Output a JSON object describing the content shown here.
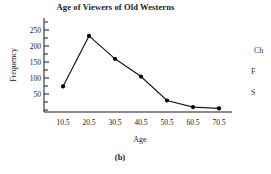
{
  "figure": {
    "caption": "(b)"
  },
  "chart_data": {
    "type": "line",
    "title": "Age of Viewers of Old Westerns",
    "xlabel": "Age",
    "ylabel": "Frequency",
    "categories": [
      "10.5",
      "20.5",
      "30.5",
      "40.5",
      "50.5",
      "60.5",
      "70.5"
    ],
    "x": [
      10.5,
      20.5,
      30.5,
      40.5,
      50.5,
      60.5,
      70.5
    ],
    "values": [
      78,
      232,
      162,
      108,
      35,
      15,
      11
    ],
    "series": [
      {
        "name": "Frequency",
        "values": [
          78,
          232,
          162,
          108,
          35,
          15,
          11
        ]
      }
    ],
    "yticks": [
      50,
      100,
      150,
      200,
      250
    ],
    "ylim": [
      0,
      270
    ],
    "xlim": [
      0.5,
      80.5
    ],
    "grid": false,
    "legend": false,
    "marker": "filled-circle",
    "line_color": "#1a1a1a",
    "marker_color": "#000000"
  },
  "side_text": {
    "lines": [
      "Ch",
      "F",
      "S"
    ]
  }
}
